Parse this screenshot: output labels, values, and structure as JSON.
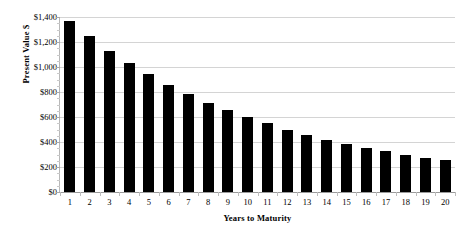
{
  "chart_data": {
    "type": "bar",
    "title": "",
    "xlabel": "Years to Maturity",
    "ylabel": "Present Value $",
    "categories": [
      "1",
      "2",
      "3",
      "4",
      "5",
      "6",
      "7",
      "8",
      "9",
      "10",
      "11",
      "12",
      "13",
      "14",
      "15",
      "16",
      "17",
      "18",
      "19",
      "20"
    ],
    "values": [
      1370,
      1250,
      1130,
      1035,
      945,
      860,
      785,
      715,
      655,
      600,
      550,
      500,
      460,
      420,
      385,
      355,
      325,
      300,
      275,
      255
    ],
    "ylim": [
      0,
      1400
    ],
    "ytick_values": [
      0,
      200,
      400,
      600,
      800,
      1000,
      1200,
      1400
    ],
    "ytick_labels": [
      "$0",
      "$200",
      "$400",
      "$600",
      "$800",
      "$1,000",
      "$1,200",
      "$1,400"
    ],
    "grid": true,
    "legend": "none",
    "bar_color": "#000000",
    "grid_color": "#d4d4d4",
    "background": "#ffffff"
  }
}
